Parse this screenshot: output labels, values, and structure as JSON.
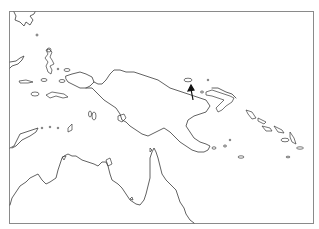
{
  "map": {
    "region": "New Guinea, eastern Indonesia and northern Australia",
    "style": "coastline outline",
    "colors": {
      "background": "#ffffff",
      "coastline": "#3a3a3a",
      "frame": "#8a8a8a",
      "marker": "#111111"
    },
    "frame": {
      "left": 9,
      "top": 11,
      "right": 313,
      "bottom": 223
    },
    "marker": {
      "type": "arrow",
      "direction": "up",
      "tip": [
        191,
        86
      ],
      "tail": [
        193,
        100
      ]
    }
  }
}
